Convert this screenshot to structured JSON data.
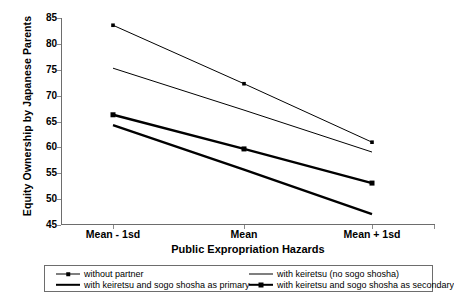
{
  "chart_data": {
    "type": "line",
    "title": "",
    "xlabel": "Public Expropriation Hazards",
    "ylabel": "Equity Ownership by Japanese Parents",
    "categories": [
      "Mean - 1sd",
      "Mean",
      "Mean + 1sd"
    ],
    "ylim": [
      45,
      85
    ],
    "yticks": [
      45,
      50,
      55,
      60,
      65,
      70,
      75,
      80,
      85
    ],
    "grid": false,
    "legend_position": "bottom",
    "series": [
      {
        "name": "without partner",
        "values": [
          83.6,
          72.3,
          61.0
        ],
        "style": "thin",
        "marker": "square-small",
        "color": "#000000"
      },
      {
        "name": "with keiretsu (no sogo shosha)",
        "values": [
          75.3,
          67.2,
          59.1
        ],
        "style": "thin",
        "marker": "none",
        "color": "#000000"
      },
      {
        "name": "with keiretsu and sogo shosha as primary",
        "values": [
          66.3,
          59.7,
          53.1
        ],
        "style": "thick",
        "marker": "square-large",
        "color": "#000000"
      },
      {
        "name": "with keiretsu and sogo shosha as secondary",
        "values": [
          64.3,
          55.7,
          47.1
        ],
        "style": "thick",
        "marker": "none",
        "color": "#000000"
      }
    ]
  },
  "axis": {
    "ylabel": "Equity Ownership by Japanese Parents",
    "xlabel": "Public Expropriation Hazards",
    "ytick_labels": [
      "85",
      "80",
      "75",
      "70",
      "65",
      "60",
      "55",
      "50",
      "45"
    ],
    "xtick_labels": [
      "Mean - 1sd",
      "Mean",
      "Mean + 1sd"
    ]
  },
  "legend": {
    "items": [
      {
        "label": "without partner"
      },
      {
        "label": "with keiretsu (no sogo shosha)"
      },
      {
        "label": "with keiretsu and sogo shosha as primary"
      },
      {
        "label": "with keiretsu and sogo shosha as secondary"
      }
    ]
  }
}
